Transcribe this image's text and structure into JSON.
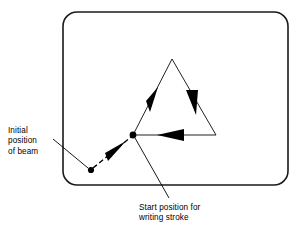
{
  "figure": {
    "screen": {
      "shape": "rounded-rectangle",
      "x": 63,
      "y": 12,
      "width": 225,
      "height": 173,
      "corner_radius": 14,
      "stroke_color": "#1a1a1a",
      "stroke_width": 1.6,
      "fill_color": "#ffffff"
    },
    "points": [
      {
        "name": "initial-position-of-beam",
        "x": 91,
        "y": 170,
        "radius": 3.1,
        "color": "#000000"
      },
      {
        "name": "start-position-for-writing-stroke",
        "x": 133,
        "y": 135,
        "radius": 3.4,
        "color": "#000000"
      }
    ],
    "positioning_stroke": {
      "name": "dashed-positioning-stroke",
      "from_x": 91,
      "from_y": 170,
      "to_x": 133,
      "to_y": 135,
      "style": "dashed",
      "dash_pattern": "5 3",
      "stroke_color": "#000000",
      "stroke_width": 1.4,
      "arrow_direction": "toward-start-position"
    },
    "triangle": {
      "name": "writing-stroke-triangle",
      "vertices": [
        {
          "label": "bottom-left",
          "x": 133,
          "y": 135
        },
        {
          "label": "apex",
          "x": 172,
          "y": 59
        },
        {
          "label": "bottom-right",
          "x": 216,
          "y": 135
        }
      ],
      "stroke_color": "#222222",
      "stroke_width": 1.0,
      "fill": "none",
      "draw_order": "counterclockwise",
      "arrows": [
        {
          "name": "arrow-left-edge-up",
          "edge": "bottom-left-to-apex",
          "t": 0.44,
          "direction": "up-right"
        },
        {
          "name": "arrow-right-edge-down",
          "edge": "apex-to-bottom-right",
          "t": 0.46,
          "direction": "down-right"
        },
        {
          "name": "arrow-bottom-edge-left",
          "edge": "bottom-right-to-bottom-left",
          "t": 0.52,
          "direction": "left"
        }
      ],
      "arrow_color": "#000000"
    },
    "leaders": [
      {
        "name": "leader-initial-position",
        "from_x": 53,
        "from_y": 139,
        "to_x": 88,
        "to_y": 168,
        "stroke_color": "#000000",
        "stroke_width": 0.9
      },
      {
        "name": "leader-start-position",
        "from_x": 169,
        "from_y": 198,
        "to_x": 135,
        "to_y": 138,
        "stroke_color": "#000000",
        "stroke_width": 0.9
      }
    ],
    "labels": {
      "initial_position": "Initial\nposition\nof beam",
      "start_position": "Start position for\nwriting stroke"
    }
  }
}
